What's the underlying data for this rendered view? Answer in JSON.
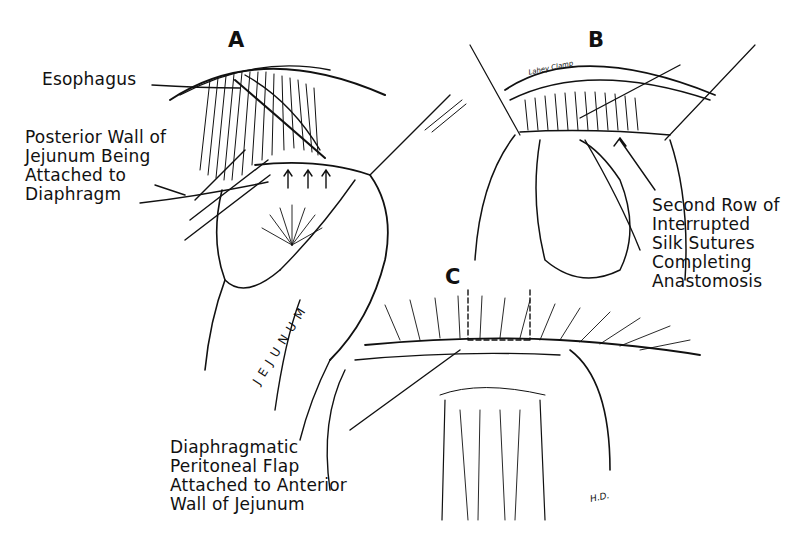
{
  "figure": {
    "panels": [
      {
        "letter": "A"
      },
      {
        "letter": "B"
      },
      {
        "letter": "C"
      }
    ],
    "labels": {
      "esophagus": "Esophagus",
      "posterior_wall": "Posterior Wall of\nJejunum Being\nAttached to\nDiaphragm",
      "second_row": "Second Row of\nInterrupted\nSilk Sutures\nCompleting\nAnastomosis",
      "diaphragmatic_flap": "Diaphragmatic\nPeritoneal Flap\nAttached to Anterior\nWall of Jejunum",
      "jejunum": "JEJUNUM",
      "lahey_clamp": "Lahey Clamp",
      "signature": "H.D."
    },
    "colors": {
      "ink": "#111111",
      "background": "#ffffff"
    }
  }
}
